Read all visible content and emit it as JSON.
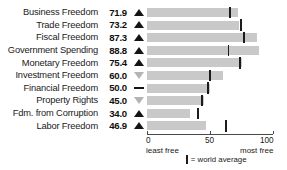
{
  "chart_data": {
    "type": "bar",
    "title": "",
    "xlabel": "",
    "ylabel": "",
    "xlim": [
      0,
      100
    ],
    "grid": false,
    "orientation": "horizontal",
    "axis_ticks": [
      {
        "value": 0,
        "label": "0"
      },
      {
        "value": 50,
        "label": "50"
      },
      {
        "value": 100,
        "label": "100"
      }
    ],
    "axis_end_labels": {
      "left": "least free",
      "right": "most free"
    },
    "legend": {
      "position": "bottom",
      "marker": "world-average-mark",
      "text": "= world average"
    },
    "categories": [
      "Business Freedom",
      "Trade Freedom",
      "Fiscal Freedom",
      "Government Spending",
      "Monetary Freedom",
      "Investment Freedom",
      "Financial Freedom",
      "Property Rights",
      "Fdm. from Corruption",
      "Labor Freedom"
    ],
    "values": [
      71.9,
      73.2,
      87.3,
      88.8,
      75.4,
      60.0,
      50.0,
      45.0,
      34.0,
      46.9
    ],
    "value_labels": [
      "71.9",
      "73.2",
      "87.3",
      "88.8",
      "75.4",
      "60.0",
      "50.0",
      "45.0",
      "34.0",
      "46.9"
    ],
    "trend_indicators": [
      "up",
      "up",
      "up",
      "up",
      "up",
      "down",
      "flat",
      "down",
      "up",
      "up"
    ],
    "world_average": [
      65.0,
      74.0,
      76.0,
      64.0,
      73.0,
      49.0,
      48.0,
      43.0,
      40.0,
      62.0
    ],
    "series": [
      {
        "name": "score",
        "values": [
          71.9,
          73.2,
          87.3,
          88.8,
          75.4,
          60.0,
          50.0,
          45.0,
          34.0,
          46.9
        ]
      },
      {
        "name": "world average",
        "values": [
          65.0,
          74.0,
          76.0,
          64.0,
          73.0,
          49.0,
          48.0,
          43.0,
          40.0,
          62.0
        ]
      }
    ],
    "colors": {
      "bar": "#c9c9c9",
      "average_mark": "#1c1c1c",
      "up_arrow": "#141414",
      "down_arrow": "#b4b4b4",
      "axis": "#4a4a4a"
    }
  }
}
